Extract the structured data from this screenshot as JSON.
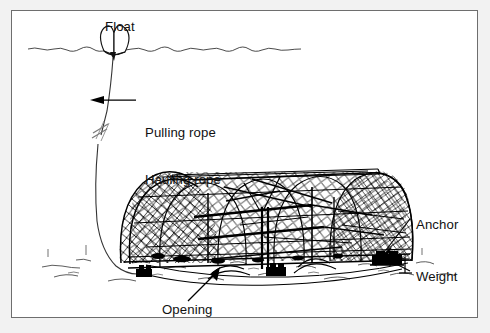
{
  "figure": {
    "kind": "technical-line-drawing",
    "style": "black ink line art on white, framed panel",
    "background_color": "#ffffff",
    "ink_color": "#000000",
    "frame_color": "#6e6e6e",
    "page_margin_color": "#f2f2f2"
  },
  "labels": {
    "float": "Float",
    "pulling_rope": "Pulling rope",
    "hauling_rope": "Hauling rope",
    "anchor": "Anchor",
    "weight": "Weight",
    "opening": "Opening"
  },
  "scene": {
    "waterline": {
      "name": "sea surface",
      "style": "wavy horizontal line",
      "x_start": 27,
      "x_end": 296,
      "y": 47
    },
    "seabed": {
      "name": "sea bottom",
      "style": "broken line with sparse stipple tufts",
      "y": 262
    },
    "float_buoy": {
      "name": "surface float",
      "shape": "double-lobed buoy",
      "x": 103,
      "y": 33
    },
    "rope": {
      "name": "pulling / hauling rope",
      "from": "float",
      "to": "trap base",
      "break_symbol": true,
      "break_symbol_y": 124
    },
    "trap": {
      "name": "arched mesh fish trap",
      "mesh": "diamond netting",
      "frame": "tubular hoops and longitudinal stringers",
      "left_edge": 118,
      "right_edge": 400,
      "top_edge": 160,
      "bottom_edge": 262
    },
    "anchor_point": {
      "x": 381,
      "y": 249
    },
    "weight_point": {
      "x": 396,
      "y": 259
    },
    "opening_point": {
      "x": 208,
      "y": 263
    }
  },
  "annotations": [
    {
      "name": "pulling-hauling-rope-callout",
      "text_line_1": "Pulling rope",
      "text_line_2": "Hauling rope",
      "arrow_direction": "left"
    },
    {
      "name": "anchor-callout",
      "text": "Anchor",
      "arrow_direction": "down-left"
    },
    {
      "name": "weight-callout",
      "text": "Weight",
      "arrow_direction": "up-left"
    },
    {
      "name": "opening-callout",
      "text": "Opening",
      "arrow_direction": "up-right"
    },
    {
      "name": "float-callout",
      "text": "Float",
      "arrow_direction": "none"
    }
  ]
}
